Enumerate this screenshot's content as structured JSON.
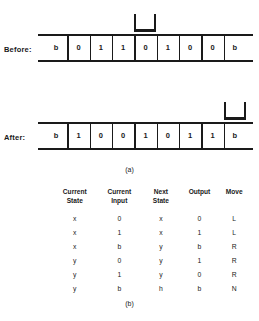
{
  "figure": {
    "panel_a_caption": "(a)",
    "panel_b_caption": "(b)"
  },
  "tapes": [
    {
      "id": "before",
      "label": "Before:",
      "cells": [
        "b",
        "0",
        "1",
        "1",
        "0",
        "1",
        "0",
        "0",
        "b"
      ],
      "head_index": 4
    },
    {
      "id": "after",
      "label": "After:",
      "cells": [
        "b",
        "1",
        "0",
        "0",
        "1",
        "0",
        "1",
        "1",
        "b"
      ],
      "head_index": 8
    }
  ],
  "table": {
    "headers": [
      {
        "line1": "Current",
        "line2": "State"
      },
      {
        "line1": "Current",
        "line2": "Input"
      },
      {
        "line1": "Next",
        "line2": "State"
      },
      {
        "line1": "Output",
        "line2": ""
      },
      {
        "line1": "Move",
        "line2": ""
      }
    ],
    "rows": [
      {
        "current_state": "x",
        "current_input": "0",
        "next_state": "x",
        "output": "0",
        "move": "L"
      },
      {
        "current_state": "x",
        "current_input": "1",
        "next_state": "x",
        "output": "1",
        "move": "L"
      },
      {
        "current_state": "x",
        "current_input": "b",
        "next_state": "y",
        "output": "b",
        "move": "R"
      },
      {
        "current_state": "y",
        "current_input": "0",
        "next_state": "y",
        "output": "1",
        "move": "R"
      },
      {
        "current_state": "y",
        "current_input": "1",
        "next_state": "y",
        "output": "0",
        "move": "R"
      },
      {
        "current_state": "y",
        "current_input": "b",
        "next_state": "h",
        "output": "b",
        "move": "N"
      }
    ]
  },
  "colors": {
    "ink": "#1a1a1a",
    "background": "#ffffff"
  }
}
